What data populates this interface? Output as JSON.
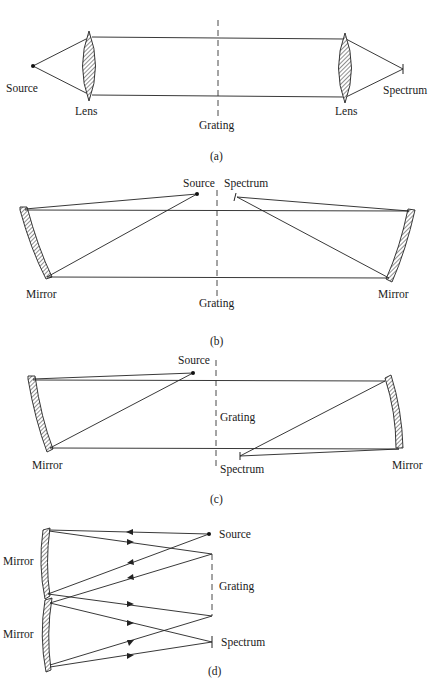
{
  "figure": {
    "panels": [
      {
        "id": "a",
        "caption": "(a)",
        "labels": {
          "source": "Source",
          "lens_left": "Lens",
          "grating": "Grating",
          "lens_right": "Lens",
          "spectrum": "Spectrum"
        }
      },
      {
        "id": "b",
        "caption": "(b)",
        "labels": {
          "source": "Source",
          "spectrum": "Spectrum",
          "mirror_left": "Mirror",
          "grating": "Grating",
          "mirror_right": "Mirror"
        }
      },
      {
        "id": "c",
        "caption": "(c)",
        "labels": {
          "source": "Source",
          "grating": "Grating",
          "mirror_left": "Mirror",
          "spectrum": "Spectrum",
          "mirror_right": "Mirror"
        }
      },
      {
        "id": "d",
        "caption": "(d)",
        "labels": {
          "mirror_upper": "Mirror",
          "source": "Source",
          "grating": "Grating",
          "mirror_lower": "Mirror",
          "spectrum": "Spectrum"
        }
      }
    ],
    "colors": {
      "ink": "#222222",
      "background": "#ffffff"
    }
  }
}
